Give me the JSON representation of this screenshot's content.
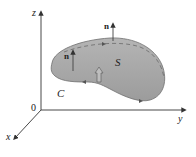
{
  "diagram": {
    "axes": {
      "z_label": "z",
      "y_label": "y",
      "x_label": "x",
      "origin_label": "0"
    },
    "surface_label": "S",
    "curve_label": "C",
    "normal_label_top": "n",
    "normal_label_left": "n",
    "colors": {
      "surface_fill": "#a9a9a9",
      "surface_edge": "#6e6e6e",
      "axis": "#333333",
      "background": "#ffffff"
    }
  }
}
